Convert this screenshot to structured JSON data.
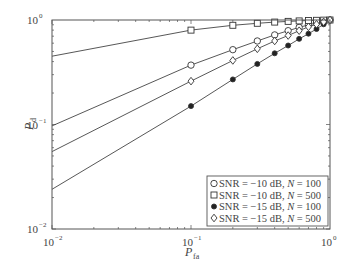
{
  "chart_data": {
    "type": "line",
    "title": "",
    "xlabel": "P_fa",
    "ylabel": "P_d",
    "xscale": "log",
    "yscale": "log",
    "xlim": [
      0.01,
      1
    ],
    "ylim": [
      0.01,
      1
    ],
    "grid": false,
    "legend_position": "lower right",
    "x_ticks": [
      {
        "value": 0.01,
        "base": "10",
        "exp": "−2"
      },
      {
        "value": 0.1,
        "base": "10",
        "exp": "−1"
      },
      {
        "value": 1,
        "base": "10",
        "exp": "0"
      }
    ],
    "y_ticks": [
      {
        "value": 0.01,
        "base": "10",
        "exp": "−2"
      },
      {
        "value": 0.1,
        "base": "10",
        "exp": "−1"
      },
      {
        "value": 1,
        "base": "10",
        "exp": "0"
      }
    ],
    "x": [
      0.01,
      0.1,
      0.2,
      0.3,
      0.4,
      0.5,
      0.6,
      0.7,
      0.8,
      0.9,
      1.0
    ],
    "marker_x": [
      0.1,
      0.2,
      0.3,
      0.4,
      0.5,
      0.6,
      0.7,
      0.8,
      0.9,
      1.0
    ],
    "series": [
      {
        "name": "SNR = −10 dB, N = 100",
        "snr": "−10",
        "n": "100",
        "marker": "circle",
        "values": [
          0.097,
          0.37,
          0.52,
          0.63,
          0.72,
          0.79,
          0.85,
          0.9,
          0.94,
          0.97,
          1.0
        ]
      },
      {
        "name": "SNR = −10 dB, N = 500",
        "snr": "−10",
        "n": "500",
        "marker": "square",
        "values": [
          0.45,
          0.8,
          0.89,
          0.93,
          0.955,
          0.97,
          0.98,
          0.988,
          0.993,
          0.997,
          1.0
        ]
      },
      {
        "name": "SNR = −15 dB, N = 100",
        "snr": "−15",
        "n": "100",
        "marker": "star",
        "values": [
          0.024,
          0.15,
          0.27,
          0.38,
          0.48,
          0.57,
          0.66,
          0.74,
          0.82,
          0.91,
          1.0
        ]
      },
      {
        "name": "SNR = −15 dB, N = 500",
        "snr": "−15",
        "n": "500",
        "marker": "diamond",
        "values": [
          0.055,
          0.26,
          0.41,
          0.53,
          0.63,
          0.71,
          0.79,
          0.86,
          0.91,
          0.96,
          1.0
        ]
      }
    ]
  },
  "labels": {
    "xlabel_main": "P",
    "xlabel_sub": "fa",
    "ylabel_main": "P",
    "ylabel_sub": "d"
  }
}
